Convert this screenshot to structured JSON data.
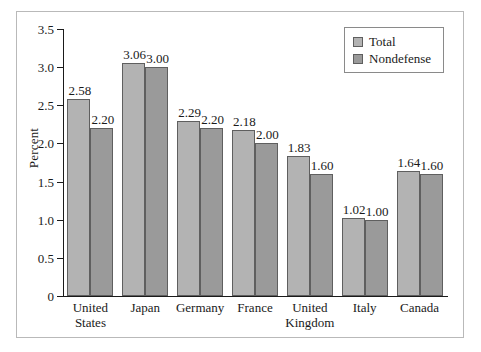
{
  "chart_data": {
    "type": "bar",
    "title": "",
    "xlabel": "",
    "ylabel": "Percent",
    "ylim": [
      0,
      3.5
    ],
    "ytick_labels": [
      "0",
      "0.5",
      "1.0",
      "1.5",
      "2.0",
      "2.5",
      "3.0",
      "3.5"
    ],
    "ytick_values": [
      0,
      0.5,
      1.0,
      1.5,
      2.0,
      2.5,
      3.0,
      3.5
    ],
    "grid": false,
    "legend_position": "top-right",
    "categories": [
      "United States",
      "Japan",
      "Germany",
      "France",
      "United Kingdom",
      "Italy",
      "Canada"
    ],
    "category_lines": [
      [
        "United",
        "States"
      ],
      [
        "Japan"
      ],
      [
        "Germany"
      ],
      [
        "France"
      ],
      [
        "United",
        "Kingdom"
      ],
      [
        "Italy"
      ],
      [
        "Canada"
      ]
    ],
    "series": [
      {
        "name": "Total",
        "color": "#b3b3b3",
        "values": [
          2.58,
          3.06,
          2.29,
          2.18,
          1.83,
          1.02,
          1.64
        ],
        "labels": [
          "2.58",
          "3.06",
          "2.29",
          "2.18",
          "1.83",
          "1.02",
          "1.64"
        ]
      },
      {
        "name": "Nondefense",
        "color": "#9a9a9a",
        "values": [
          2.2,
          3.0,
          2.2,
          2.0,
          1.6,
          1.0,
          1.6
        ],
        "labels": [
          "2.20",
          "3.00",
          "2.20",
          "2.00",
          "1.60",
          "1.00",
          "1.60"
        ]
      }
    ]
  },
  "legend": {
    "items": [
      {
        "label": "Total",
        "swatch": "total"
      },
      {
        "label": "Nondefense",
        "swatch": "nondefense"
      }
    ]
  },
  "axis": {
    "y_title": "Percent"
  }
}
